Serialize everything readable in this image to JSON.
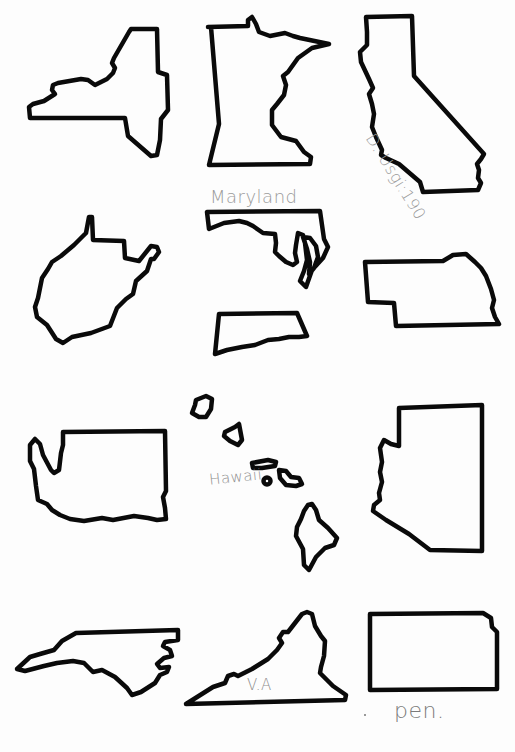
{
  "worksheet": {
    "title": "US state outlines",
    "states": [
      {
        "id": "new-york",
        "name": "New York"
      },
      {
        "id": "minnesota",
        "name": "Minnesota"
      },
      {
        "id": "california",
        "name": "California"
      },
      {
        "id": "west-virginia",
        "name": "West Virginia"
      },
      {
        "id": "maryland",
        "name": "Maryland"
      },
      {
        "id": "pennsylvania-fragment",
        "name": "Pennsylvania"
      },
      {
        "id": "nebraska",
        "name": "Nebraska"
      },
      {
        "id": "washington",
        "name": "Washington"
      },
      {
        "id": "hawaii",
        "name": "Hawaii"
      },
      {
        "id": "arizona",
        "name": "Arizona"
      },
      {
        "id": "north-carolina",
        "name": "North Carolina"
      },
      {
        "id": "virginia",
        "name": "Virginia"
      },
      {
        "id": "kansas",
        "name": "Kansas"
      }
    ],
    "labels": {
      "california": "D. Usgi:190",
      "maryland": "Maryland",
      "hawaii": "Hawaii",
      "virginia": "V.A",
      "pen": "pen."
    },
    "colors": {
      "outline": "#0a0a0a",
      "pencil": "#8a8a8a",
      "paper": "#fdfdfd"
    }
  }
}
